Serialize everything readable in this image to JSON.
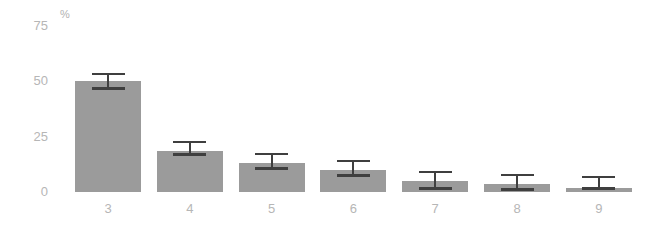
{
  "chart_data": {
    "type": "bar",
    "categories": [
      "3",
      "4",
      "5",
      "6",
      "7",
      "8",
      "9"
    ],
    "values": [
      50,
      18.5,
      13,
      10,
      5,
      3.5,
      2
    ],
    "error_high": [
      53.5,
      22.5,
      17,
      14,
      9,
      7.5,
      7
    ],
    "error_low": [
      47,
      17,
      11,
      7.5,
      2,
      1.5,
      2
    ],
    "title": "",
    "xlabel": "",
    "ylabel": "%",
    "ylim": [
      0,
      75
    ],
    "yticks": [
      0,
      25,
      50,
      75
    ],
    "grid": false,
    "legend": false,
    "colors": {
      "bar_fill": "#9b9b9b",
      "error_bar": "#3f3f3f",
      "tick_labels": "#b6b6b6",
      "background": "#ffffff"
    }
  }
}
